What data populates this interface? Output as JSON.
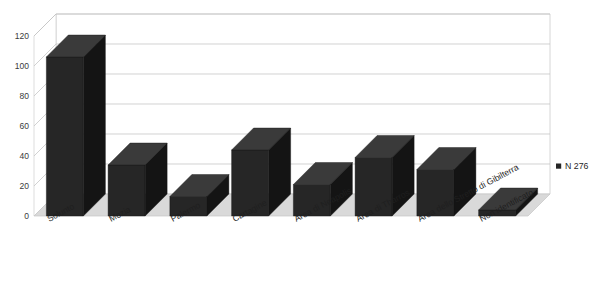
{
  "chart_data": {
    "type": "bar",
    "title": "",
    "subtitle": "",
    "xlabel": "",
    "ylabel": "",
    "ylim": [
      0,
      120
    ],
    "yticks": [
      0,
      20,
      40,
      60,
      80,
      100,
      120
    ],
    "grid": true,
    "three_d": true,
    "legend_position": "right",
    "categories": [
      "Solunto",
      "Mozia",
      "Palermo",
      "Cartagine",
      "Area di Neapolis",
      "Area di Tharros",
      "Area dello Stretto di Gibilterra",
      "Non identificato"
    ],
    "series": [
      {
        "name": "N 276",
        "color": "#262626",
        "values": [
          106,
          34,
          13,
          44,
          21,
          39,
          31,
          4
        ]
      }
    ]
  },
  "legend": {
    "entries": [
      {
        "label": "N 276",
        "swatch_color": "#262626"
      }
    ]
  },
  "axes": {
    "y_tick_labels": [
      "120",
      "100",
      "80",
      "60",
      "40",
      "20",
      "0"
    ],
    "x_tick_labels": [
      "Solunto",
      "Mozia",
      "Palermo",
      "Cartagine",
      "Area di Neapolis",
      "Area di Tharros",
      "Area dello Stretto di Gibilterra",
      "Non identificato"
    ]
  },
  "style": {
    "bar_face_color": "#262626",
    "bar_top_color": "#3a3a3a",
    "bar_side_color": "#141414",
    "floor_color": "#d9d9d9",
    "gridline_color": "#bfbfbf",
    "wall_color": "#ffffff",
    "plot_border_color": "#cccccc",
    "background": "#ffffff"
  }
}
